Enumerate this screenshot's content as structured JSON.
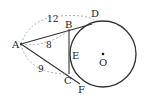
{
  "diagram": {
    "points": {
      "A": {
        "label": "A",
        "x": 20,
        "y": 44
      },
      "B": {
        "label": "B",
        "x": 68,
        "y": 29
      },
      "C": {
        "label": "C",
        "x": 68,
        "y": 75
      },
      "D": {
        "label": "D",
        "x": 96,
        "y": 17
      },
      "E": {
        "label": "E",
        "x": 71,
        "y": 54
      },
      "F": {
        "label": "F",
        "x": 82,
        "y": 91
      },
      "O": {
        "label": "O",
        "x": 103,
        "y": 54
      }
    },
    "circle": {
      "center": "O",
      "radius": 33
    },
    "measures": {
      "AD": "12",
      "AB": "8",
      "AC": "9"
    },
    "colors": {
      "line": "#333333",
      "dashed": "#999999"
    }
  }
}
